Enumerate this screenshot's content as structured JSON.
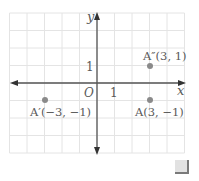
{
  "diagram": {
    "type": "coordinate-plane",
    "x_axis_label": "x",
    "y_axis_label": "y",
    "origin_label": "O",
    "x_tick_label": "1",
    "y_tick_label": "1",
    "grid": {
      "x_range": [
        -5,
        5
      ],
      "y_range": [
        -4,
        4
      ],
      "step": 1
    },
    "points": [
      {
        "name": "A''",
        "label": "A″(3, 1)",
        "x": 3,
        "y": 1
      },
      {
        "name": "A",
        "label": "A(3, −1)",
        "x": 3,
        "y": -1
      },
      {
        "name": "A'",
        "label": "A′(−3, −1)",
        "x": -3,
        "y": -1
      }
    ],
    "colors": {
      "axis": "#555555",
      "grid": "#e4e4e4",
      "point": "#8a8a8a",
      "text": "#5a5a5a"
    }
  },
  "ui": {
    "corner_button": "resize-handle"
  }
}
